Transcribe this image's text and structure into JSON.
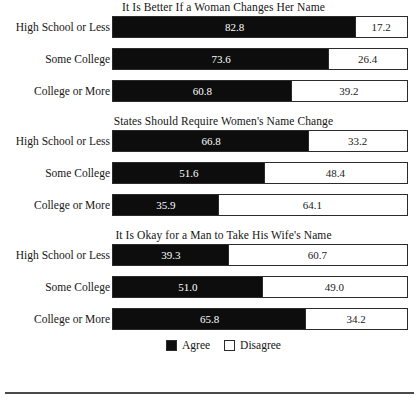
{
  "figure": {
    "legend": {
      "agree_label": "Agree",
      "disagree_label": "Disagree"
    }
  },
  "chart_data": {
    "type": "bar",
    "orientation": "horizontal",
    "stacked": true,
    "percent_stacked": true,
    "xlim": [
      0,
      100
    ],
    "xlabel": "",
    "ylabel": "",
    "grid": false,
    "legend_position": "bottom-center",
    "legend_entries": [
      "Agree",
      "Disagree"
    ],
    "categories": [
      "High School or Less",
      "Some College",
      "College or More"
    ],
    "panels": [
      {
        "title": "It Is Better If a Woman Changes Her Name",
        "rows": [
          {
            "category": "High School or Less",
            "agree": 82.8,
            "disagree": 17.2,
            "agree_label": "82.8",
            "disagree_label": "17.2"
          },
          {
            "category": "Some College",
            "agree": 73.6,
            "disagree": 26.4,
            "agree_label": "73.6",
            "disagree_label": "26.4"
          },
          {
            "category": "College or More",
            "agree": 60.8,
            "disagree": 39.2,
            "agree_label": "60.8",
            "disagree_label": "39.2"
          }
        ]
      },
      {
        "title": "States Should Require Women's Name Change",
        "rows": [
          {
            "category": "High School or Less",
            "agree": 66.8,
            "disagree": 33.2,
            "agree_label": "66.8",
            "disagree_label": "33.2"
          },
          {
            "category": "Some College",
            "agree": 51.6,
            "disagree": 48.4,
            "agree_label": "51.6",
            "disagree_label": "48.4"
          },
          {
            "category": "College or More",
            "agree": 35.9,
            "disagree": 64.1,
            "agree_label": "35.9",
            "disagree_label": "64.1"
          }
        ]
      },
      {
        "title": "It Is Okay for a Man to Take His Wife's Name",
        "rows": [
          {
            "category": "High School or Less",
            "agree": 39.3,
            "disagree": 60.7,
            "agree_label": "39.3",
            "disagree_label": "60.7"
          },
          {
            "category": "Some College",
            "agree": 51.0,
            "disagree": 49.0,
            "agree_label": "51.0",
            "disagree_label": "49.0"
          },
          {
            "category": "College or More",
            "agree": 65.8,
            "disagree": 34.2,
            "agree_label": "65.8",
            "disagree_label": "34.2"
          }
        ]
      }
    ],
    "colors": {
      "agree": "#0d0d0d",
      "disagree": "#ffffff",
      "outline": "#2b2b2b",
      "text": "#1a1a1a"
    }
  }
}
